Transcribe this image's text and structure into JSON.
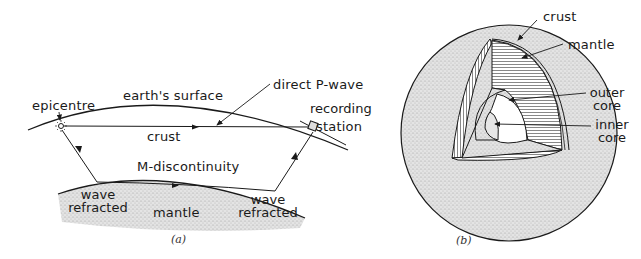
{
  "figure_a": {
    "caption": "(a)",
    "labels": {
      "epicentre": "epicentre",
      "earths_surface": "earth's surface",
      "direct_p_wave": "direct P-wave",
      "recording_station_line1": "recording",
      "recording_station_line2": "station",
      "crust": "crust",
      "m_discontinuity": "M-discontinuity",
      "wave_refracted_left_line1": "wave",
      "wave_refracted_left_line2": "refracted",
      "mantle": "mantle",
      "wave_refracted_right_line1": "wave",
      "wave_refracted_right_line2": "refracted"
    }
  },
  "figure_b": {
    "caption": "(b)",
    "labels": {
      "crust": "crust",
      "mantle": "mantle",
      "outer_core_line1": "outer",
      "outer_core_line2": "core",
      "inner_core_line1": "inner",
      "inner_core_line2": "core"
    }
  },
  "colors": {
    "ink": "#1a1a1a",
    "stipple": "#d9d9d9"
  }
}
